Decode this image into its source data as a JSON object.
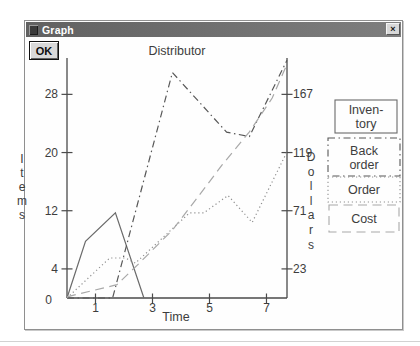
{
  "window": {
    "title": "Graph",
    "close_glyph": "×"
  },
  "ok_button": "OK",
  "chart_data": {
    "type": "line",
    "title": "Distributor",
    "xlabel": "Time",
    "x_ticks": [
      1,
      3,
      5,
      7
    ],
    "x_range": [
      0,
      7.72
    ],
    "left_axis": {
      "label": "Items",
      "origin_tick": "0",
      "ticks": [
        4,
        12,
        20,
        28
      ],
      "range": [
        0,
        33
      ]
    },
    "right_axis": {
      "label": "Dollars",
      "ticks": [
        23,
        71,
        119,
        167
      ],
      "range": [
        0,
        197
      ]
    },
    "grid": false,
    "legend_position": "right-outside",
    "legend_labels": [
      [
        "Inven-",
        "tory"
      ],
      [
        "Back",
        "order"
      ],
      [
        "Order"
      ],
      [
        "Cost"
      ]
    ],
    "series": [
      {
        "name": "Inventory",
        "axis": "left",
        "style": "solid",
        "points": [
          [
            0,
            0
          ],
          [
            0.65,
            7.8
          ],
          [
            1.7,
            11.7
          ],
          [
            2.7,
            0
          ]
        ]
      },
      {
        "name": "Back order",
        "axis": "left",
        "style": "dash-dot",
        "points": [
          [
            0,
            0
          ],
          [
            1.6,
            0
          ],
          [
            3.7,
            31
          ],
          [
            5.6,
            22.8
          ],
          [
            6.4,
            22.2
          ],
          [
            7.72,
            32.7
          ]
        ]
      },
      {
        "name": "Order",
        "axis": "left",
        "style": "dotted",
        "points": [
          [
            0,
            0
          ],
          [
            1.5,
            5.5
          ],
          [
            2.05,
            5.5
          ],
          [
            2.4,
            4.8
          ],
          [
            4.3,
            11.7
          ],
          [
            4.8,
            11.7
          ],
          [
            5.65,
            14.1
          ],
          [
            6.5,
            10.4
          ],
          [
            7.72,
            20.1
          ]
        ]
      },
      {
        "name": "Cost",
        "axis": "right",
        "style": "long-dash",
        "points": [
          [
            0,
            0
          ],
          [
            1.75,
            10
          ],
          [
            2.55,
            28
          ],
          [
            3.7,
            55
          ],
          [
            4.55,
            81
          ],
          [
            5.45,
            109
          ],
          [
            6.4,
            136
          ],
          [
            7.2,
            164
          ],
          [
            7.72,
            192
          ]
        ]
      }
    ]
  },
  "colors": {
    "titlebar": "#6c6c6c",
    "titlebar_text": "#ffffff",
    "window_bg": "#fefefe",
    "button_face": "#d9d9d9",
    "axis": "#4a4a4a",
    "text": "#3d3d3d",
    "series": {
      "Inventory": "#6a6a6a",
      "Back order": "#575757",
      "Order": "#8f8f8f",
      "Cost": "#a8a8a8"
    }
  }
}
